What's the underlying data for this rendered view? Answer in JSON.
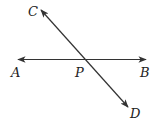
{
  "diagram": {
    "type": "intersecting-lines",
    "lines": [
      {
        "name": "line-AB",
        "from": "A",
        "to": "B",
        "arrows": "both"
      },
      {
        "name": "line-CD",
        "from": "C",
        "to": "D",
        "arrows": "both"
      }
    ],
    "points": {
      "A": {
        "label": "A"
      },
      "B": {
        "label": "B"
      },
      "C": {
        "label": "C"
      },
      "D": {
        "label": "D"
      },
      "P": {
        "label": "P"
      }
    },
    "intersection": "P",
    "stroke_color": "#333333"
  }
}
